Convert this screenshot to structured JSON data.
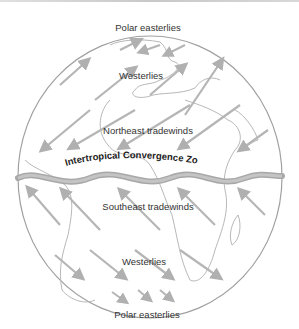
{
  "diagram": {
    "labels": {
      "polar_easterlies_north": "Polar easterlies",
      "westerlies_north": "Westerlies",
      "northeast_tradewinds": "Northeast tradewinds",
      "itcz": "Intertropical Convergence Zone",
      "southeast_tradewinds": "Southeast tradewinds",
      "westerlies_south": "Westerlies",
      "polar_easterlies_south": "Polar easterlies"
    },
    "colors": {
      "outline": "#9a9a9a",
      "arrow": "#b5b5b5",
      "itcz_band": "#a8a8a8",
      "text": "#333333"
    }
  }
}
